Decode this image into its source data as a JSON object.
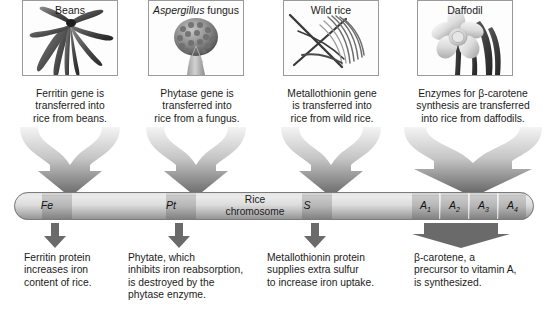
{
  "figure": {
    "chromosome_label_line1": "Rice",
    "chromosome_label_line2": "chromosome"
  },
  "sources": [
    {
      "name": "beans",
      "image_label": "Beans",
      "image_label_italic": false,
      "icon": "bean-pods-image",
      "transfer_caption": "Ferritin gene is transferred into rice from beans.",
      "transfer_lines": [
        "Ferritin gene is",
        "transferred into",
        "rice from beans."
      ],
      "gene_marker": "Fe",
      "gene_marker_sub": "",
      "result_caption": "Ferritin protein increases iron content of rice.",
      "result_lines": [
        "Ferritin protein",
        "increases iron",
        "content of rice."
      ]
    },
    {
      "name": "aspergillus",
      "image_label": "Aspergillus fungus",
      "image_label_italic_part": "Aspergillus",
      "image_label_roman_part": " fungus",
      "image_label_italic": true,
      "icon": "aspergillus-conidiophore-image",
      "transfer_caption": "Phytase gene is transferred into rice from a fungus.",
      "transfer_lines": [
        "Phytase gene is",
        "transferred into",
        "rice from a fungus."
      ],
      "gene_marker": "Pt",
      "gene_marker_sub": "",
      "result_caption": "Phytate, which inhibits iron reabsorption, is destroyed by the phytase enzyme.",
      "result_lines": [
        "Phytate, which",
        "inhibits iron reabsorption,",
        "is destroyed by the",
        "phytase enzyme."
      ]
    },
    {
      "name": "wild-rice",
      "image_label": "Wild rice",
      "image_label_italic": false,
      "icon": "wild-rice-grass-image",
      "transfer_caption": "Metallothionin gene is transferred into rice from wild rice.",
      "transfer_lines": [
        "Metallothionin gene",
        "is transferred into",
        "rice from wild rice."
      ],
      "gene_marker": "S",
      "gene_marker_sub": "",
      "result_caption": "Metallothionin protein supplies extra sulfur to increase iron uptake.",
      "result_lines": [
        "Metallothionin protein",
        "supplies extra sulfur",
        "to increase iron uptake."
      ]
    },
    {
      "name": "daffodil",
      "image_label": "Daffodil",
      "image_label_italic": false,
      "icon": "daffodil-flower-image",
      "transfer_caption": "Enzymes for β-carotene synthesis are transferred into rice from daffodils.",
      "transfer_lines": [
        "Enzymes for β-carotene",
        "synthesis are transferred",
        "into rice from daffodils."
      ],
      "gene_marker": "A",
      "gene_marker_sub": "1,2,3,4",
      "result_caption": "β-carotene, a precursor to vitamin A, is synthesized.",
      "result_lines": [
        "β-carotene, a",
        "precursor to vitamin A,",
        "is synthesized."
      ]
    }
  ],
  "gene_loci": [
    {
      "label": "Fe",
      "sub": ""
    },
    {
      "label": "Pt",
      "sub": ""
    },
    {
      "label": "S",
      "sub": ""
    },
    {
      "label": "A",
      "sub": "1"
    },
    {
      "label": "A",
      "sub": "2"
    },
    {
      "label": "A",
      "sub": "3"
    },
    {
      "label": "A",
      "sub": "4"
    }
  ],
  "colors": {
    "background": "#ffffff",
    "text": "#1b1b1b",
    "panel_border": "#9a9a9a",
    "chromosome_light": "#e3e3e3",
    "chromosome_mid": "#c9c9c9",
    "chromosome_dark": "#9f9f9f",
    "locus_fill": "#a9a9a9",
    "arrow_light": "#f2f2f2",
    "arrow_dark": "#6e6e6e",
    "small_arrow": "#6a6a6a"
  }
}
